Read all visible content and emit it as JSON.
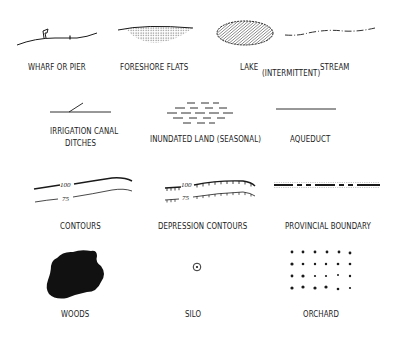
{
  "legend": {
    "items": [
      {
        "id": "wharf",
        "label": "WHARF OR PIER"
      },
      {
        "id": "foreshore",
        "label": "FORESHORE FLATS"
      },
      {
        "id": "lake",
        "label": "LAKE"
      },
      {
        "id": "intermittent",
        "label": "(INTERMITTENT)"
      },
      {
        "id": "stream",
        "label": "STREAM"
      },
      {
        "id": "irrigation",
        "label": "IRRIGATION CANAL"
      },
      {
        "id": "ditches",
        "label": "DITCHES"
      },
      {
        "id": "inundated",
        "label": "INUNDATED LAND (SEASONAL)"
      },
      {
        "id": "aqueduct",
        "label": "AQUEDUCT"
      },
      {
        "id": "contours",
        "label": "CONTOURS"
      },
      {
        "id": "depression",
        "label": "DEPRESSION CONTOURS"
      },
      {
        "id": "provincial",
        "label": "PROVINCIAL BOUNDARY"
      },
      {
        "id": "woods",
        "label": "WOODS"
      },
      {
        "id": "silo",
        "label": "SILO"
      },
      {
        "id": "orchard",
        "label": "ORCHARD"
      }
    ],
    "contour_values": {
      "upper": "100",
      "lower": "75"
    },
    "colors": {
      "ink": "#1a1a1a",
      "background": "#ffffff"
    }
  }
}
